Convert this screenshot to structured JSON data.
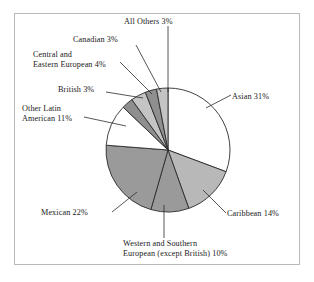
{
  "chart_data": {
    "type": "pie",
    "title": "",
    "subtitle": "",
    "xlabel": "",
    "ylabel": "",
    "legend_position": "none",
    "grid": false,
    "start_angle_deg": 0,
    "direction": "clockwise",
    "units": "percent",
    "categories": [
      "Asian",
      "Caribbean",
      "Western and Southern European (except British)",
      "Mexican",
      "Other Latin American",
      "British",
      "Central and Eastern European",
      "Canadian",
      "All Others"
    ],
    "values": [
      31,
      14,
      10,
      22,
      11,
      3,
      4,
      3,
      3
    ],
    "slices": [
      {
        "name": "Asian",
        "value": 31,
        "label": "Asian 31%",
        "fill": "#ffffff"
      },
      {
        "name": "Caribbean",
        "value": 14,
        "label": "Caribbean 14%",
        "fill": "#b8b8b8"
      },
      {
        "name": "Western and Southern European (except British)",
        "value": 10,
        "label_line1": "Western and Southern",
        "label_line2": "European (except British) 10%",
        "fill": "#9a9a9a"
      },
      {
        "name": "Mexican",
        "value": 22,
        "label": "Mexican 22%",
        "fill": "#9a9a9a"
      },
      {
        "name": "Other Latin American",
        "value": 11,
        "label_line1": "Other Latin",
        "label_line2": "American 11%",
        "fill": "#ffffff"
      },
      {
        "name": "British",
        "value": 3,
        "label": "British 3%",
        "fill": "#8f8f8f"
      },
      {
        "name": "Central and Eastern European",
        "value": 4,
        "label_line1": "Central and",
        "label_line2": "Eastern European 4%",
        "fill": "#c4c4c4"
      },
      {
        "name": "Canadian",
        "value": 3,
        "label": "Canadian 3%",
        "fill": "#8f8f8f"
      },
      {
        "name": "All Others",
        "value": 3,
        "label": "All Others 3%",
        "fill": "#c4c4c4"
      }
    ]
  },
  "labels": {
    "all_others": "All Others 3%",
    "canadian": "Canadian 3%",
    "central_line1": "Central and",
    "central_line2": "Eastern European 4%",
    "british": "British 3%",
    "other_latin_line1": "Other Latin",
    "other_latin_line2": "American 11%",
    "asian": "Asian 31%",
    "caribbean": "Caribbean 14%",
    "mexican": "Mexican 22%",
    "western_line1": "Western and Southern",
    "western_line2": "European (except British) 10%"
  },
  "colors": {
    "outline": "#2b2b2b",
    "frame": "#b9b9b9",
    "background": "#ffffff",
    "fill_light": "#c4c4c4",
    "fill_medium": "#b8b8b8",
    "fill_dark": "#9a9a9a",
    "fill_darker": "#8f8f8f",
    "fill_white": "#ffffff"
  }
}
